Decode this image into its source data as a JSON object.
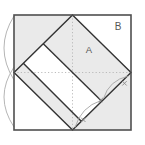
{
  "figure": {
    "viewbox": "0 0 145 145",
    "labels": {
      "region_a": "A",
      "region_b": "B"
    },
    "colors": {
      "background": "#ffffff",
      "region_fill": "#eaeaea",
      "square_border": "#4f4f4f",
      "diamond_line": "#333333",
      "dashed_line": "#b5b5b5",
      "construction_arc": "#adadad",
      "compass_mark": "#8a8a8a",
      "label_text": "#565656"
    },
    "shapes": [
      {
        "tag": "rect",
        "name": "outer-square-fill",
        "attrs": {
          "x": 14,
          "y": 15,
          "width": 117,
          "height": 115,
          "fill": "#ffffff",
          "stroke": "none"
        }
      },
      {
        "tag": "polygon",
        "name": "corner-triangle-top-left",
        "attrs": {
          "points": "14,15 72.5,15 14,72.5",
          "fill": "#eaeaea",
          "stroke": "none"
        }
      },
      {
        "tag": "polygon",
        "name": "corner-triangle-bottom-right",
        "attrs": {
          "points": "131,72.5 131,130 72.5,130",
          "fill": "#eaeaea",
          "stroke": "none"
        }
      },
      {
        "tag": "polygon",
        "name": "diamond-strip-upper-shaded",
        "attrs": {
          "points": "72.5,15 131,72.5 101.75,101.25 43.25,43.75",
          "fill": "#eaeaea",
          "stroke": "none"
        }
      },
      {
        "tag": "polygon",
        "name": "diamond-strip-lower-shaded",
        "attrs": {
          "points": "23.3,63.3 81.3,121.3 72.5,130 14,72.5",
          "fill": "#eaeaea",
          "stroke": "none"
        }
      },
      {
        "tag": "path",
        "name": "construction-arc-left-upper",
        "attrs": {
          "d": "M14,16 Q-6,48 14,80",
          "fill": "none",
          "stroke": "#adadad",
          "stroke-width": 0.9
        }
      },
      {
        "tag": "path",
        "name": "construction-arc-left-lower",
        "attrs": {
          "d": "M14,67 Q-6,97 14,127",
          "fill": "none",
          "stroke": "#adadad",
          "stroke-width": 0.9
        }
      },
      {
        "tag": "line",
        "name": "dashed-centerline-horizontal",
        "attrs": {
          "x1": 14,
          "y1": 72.5,
          "x2": 131,
          "y2": 72.5,
          "stroke": "#b5b5b5",
          "stroke-width": 0.9,
          "stroke-dasharray": "1.2 2.2"
        }
      },
      {
        "tag": "line",
        "name": "dashed-centerline-vertical",
        "attrs": {
          "x1": 72.5,
          "y1": 15,
          "x2": 72.5,
          "y2": 130,
          "stroke": "#b5b5b5",
          "stroke-width": 0.9,
          "stroke-dasharray": "1.2 2.2"
        }
      },
      {
        "tag": "polygon",
        "name": "inscribed-diamond-outline",
        "attrs": {
          "points": "72.5,15 131,72.5 72.5,130 14,72.5",
          "fill": "none",
          "stroke": "#333333",
          "stroke-width": 1.4,
          "stroke-linejoin": "miter"
        }
      },
      {
        "tag": "line",
        "name": "inner-strip-line-upper",
        "attrs": {
          "x1": 43.25,
          "y1": 43.75,
          "x2": 101.75,
          "y2": 101.25,
          "stroke": "#333333",
          "stroke-width": 1.4
        }
      },
      {
        "tag": "line",
        "name": "inner-strip-line-lower",
        "attrs": {
          "x1": 23.3,
          "y1": 63.3,
          "x2": 81.3,
          "y2": 121.3,
          "stroke": "#333333",
          "stroke-width": 1.4
        }
      },
      {
        "tag": "path",
        "name": "construction-arc-edge-lower",
        "attrs": {
          "d": "M75,127.5 Q81,107 101,100.5",
          "fill": "none",
          "stroke": "#a5a5a5",
          "stroke-width": 0.9
        }
      },
      {
        "tag": "path",
        "name": "construction-arc-edge-upper",
        "attrs": {
          "d": "M103.5,98.5 Q109,80.25 128.5,76",
          "fill": "none",
          "stroke": "#a5a5a5",
          "stroke-width": 0.9
        }
      },
      {
        "tag": "path",
        "name": "compass-x-mark-bottom",
        "attrs": {
          "d": "M81.1,117.6 L85.5,122 M85.5,117.6 L81.1,122",
          "stroke": "#8a8a8a",
          "stroke-width": 0.9,
          "fill": "none"
        }
      },
      {
        "tag": "path",
        "name": "compass-x-mark-middle",
        "attrs": {
          "d": "M98.6,97.8 L103,102.2 M103,97.8 L98.6,102.2",
          "stroke": "#8a8a8a",
          "stroke-width": 0.9,
          "fill": "none"
        }
      },
      {
        "tag": "path",
        "name": "compass-x-mark-top",
        "attrs": {
          "d": "M122.3,81.1 L126.7,85.5 M126.7,81.1 L122.3,85.5",
          "stroke": "#8a8a8a",
          "stroke-width": 0.9,
          "fill": "none"
        }
      },
      {
        "tag": "rect",
        "name": "outer-square-border",
        "attrs": {
          "x": 14,
          "y": 15,
          "width": 117,
          "height": 115,
          "fill": "none",
          "stroke": "#4f4f4f",
          "stroke-width": 1.6
        }
      },
      {
        "tag": "text",
        "name": "label-region-a",
        "text_bind": "figure.labels.region_a",
        "attrs": {
          "x": 89,
          "y": 53.2,
          "font-size": 9.5,
          "fill": "#565656",
          "text-anchor": "middle"
        }
      },
      {
        "tag": "text",
        "name": "label-region-b",
        "text_bind": "figure.labels.region_b",
        "attrs": {
          "x": 118,
          "y": 29.5,
          "font-size": 10,
          "fill": "#565656",
          "text-anchor": "middle"
        }
      }
    ]
  }
}
